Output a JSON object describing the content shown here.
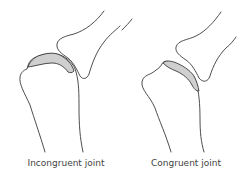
{
  "figure": {
    "panels": [
      {
        "id": "incongruent",
        "label": "Incongruent joint",
        "cartilage_color": "#cfcfcf"
      },
      {
        "id": "congruent",
        "label": "Congruent joint",
        "cartilage_color": "#cfcfcf"
      }
    ]
  }
}
